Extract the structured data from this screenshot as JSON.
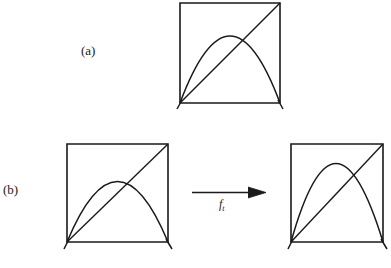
{
  "figure": {
    "background_color": "#ffffff",
    "stroke_color": "#1a1a1a",
    "panels": [
      {
        "id": "a",
        "label": "(a)",
        "label_position": {
          "x": 81,
          "y": 44
        },
        "squares": [
          {
            "name": "square-a",
            "x": 180,
            "y": 3,
            "width": 100,
            "height": 100,
            "diagonal": "bottom-left to top-right",
            "curve": "parabola",
            "curve_peak_height_fraction": 0.67,
            "curve_peak_x_fraction": 0.5
          }
        ]
      },
      {
        "id": "b",
        "label": "(b)",
        "label_position": {
          "x": 3,
          "y": 183
        },
        "squares": [
          {
            "name": "square-b-left",
            "x": 67,
            "y": 144,
            "width": 101,
            "height": 98,
            "diagonal": "bottom-left to top-right",
            "curve": "parabola",
            "curve_peak_height_fraction": 0.62,
            "curve_peak_x_fraction": 0.5
          },
          {
            "name": "square-b-right",
            "x": 291,
            "y": 144,
            "width": 92,
            "height": 98,
            "diagonal": "bottom-left to top-right",
            "curve": "parabola",
            "curve_peak_height_fraction": 0.87,
            "curve_peak_x_fraction": 0.46
          }
        ],
        "arrow": {
          "name": "transform-arrow",
          "x1": 192,
          "y1": 192,
          "x2": 266,
          "y2": 192,
          "label": "f",
          "label_subscript": "t"
        }
      }
    ]
  }
}
